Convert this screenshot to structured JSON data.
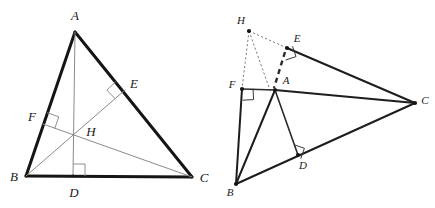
{
  "figure": {
    "background_color": "#ffffff",
    "width": 435,
    "height": 208,
    "panel_count": 2
  },
  "colors": {
    "side_stroke": "#151515",
    "cevian_stroke": "#8a8a8a",
    "dashed_stroke": "#7d7d7d",
    "right_angle_stroke": "#8f8f8f",
    "label_fill": "#1a1a1a",
    "point_fill": "#151515"
  },
  "left_panel": {
    "name": "acute-triangle-orthocenter",
    "description": "Acute triangle ABC with altitudes AD, BE and CF meeting at interior orthocenter H",
    "labels": [
      {
        "id": "A",
        "text": "A",
        "x": 75,
        "y": 17
      },
      {
        "id": "B",
        "text": "B",
        "x": 14,
        "y": 178
      },
      {
        "id": "C",
        "text": "C",
        "x": 204,
        "y": 179
      },
      {
        "id": "D",
        "text": "D",
        "x": 74,
        "y": 194
      },
      {
        "id": "E",
        "text": "E",
        "x": 134,
        "y": 85
      },
      {
        "id": "F",
        "text": "F",
        "x": 32,
        "y": 118
      },
      {
        "id": "H",
        "text": "H",
        "x": 91,
        "y": 133
      }
    ],
    "points": {
      "A": {
        "x": 75,
        "y": 32
      },
      "B": {
        "x": 26,
        "y": 176
      },
      "C": {
        "x": 192,
        "y": 177
      },
      "D": {
        "x": 73,
        "y": 176
      },
      "E": {
        "x": 125,
        "y": 90
      },
      "F": {
        "x": 43,
        "y": 124
      },
      "H": {
        "x": 73,
        "y": 133
      }
    },
    "sides": [
      {
        "name": "side-AB",
        "from": "A",
        "to": "B",
        "weight": "thick"
      },
      {
        "name": "side-AC",
        "from": "A",
        "to": "C",
        "weight": "thick"
      },
      {
        "name": "side-BC",
        "from": "B",
        "to": "C",
        "weight": "thick"
      }
    ],
    "altitudes": [
      {
        "name": "altitude-AD",
        "from": "A",
        "to": "D",
        "weight": "thin"
      },
      {
        "name": "altitude-BE",
        "from": "B",
        "to": "E",
        "weight": "thin"
      },
      {
        "name": "altitude-CF",
        "from": "C",
        "to": "F",
        "weight": "thin"
      }
    ],
    "right_angles": [
      {
        "name": "right-angle-at-D",
        "vertex": "D",
        "size": 12
      },
      {
        "name": "right-angle-at-E",
        "vertex": "E",
        "size": 12
      },
      {
        "name": "right-angle-at-F",
        "vertex": "F",
        "size": 12
      }
    ]
  },
  "right_panel": {
    "name": "obtuse-triangle-orthocenter",
    "description": "Obtuse triangle ABC with altitude feet D, E, F and exterior orthocenter H joined by dashed segments",
    "labels": [
      {
        "id": "H",
        "text": "H",
        "x": 241,
        "y": 21
      },
      {
        "id": "E",
        "text": "E",
        "x": 297,
        "y": 39
      },
      {
        "id": "A",
        "text": "A",
        "x": 286,
        "y": 81
      },
      {
        "id": "F",
        "text": "F",
        "x": 232,
        "y": 85
      },
      {
        "id": "C",
        "text": "C",
        "x": 425,
        "y": 101
      },
      {
        "id": "D",
        "text": "D",
        "x": 303,
        "y": 166
      },
      {
        "id": "B",
        "text": "B",
        "x": 230,
        "y": 193
      }
    ],
    "points": {
      "H": {
        "x": 249,
        "y": 31
      },
      "E": {
        "x": 287,
        "y": 48
      },
      "A": {
        "x": 275,
        "y": 90
      },
      "F": {
        "x": 242,
        "y": 89
      },
      "C": {
        "x": 415,
        "y": 103
      },
      "D": {
        "x": 298,
        "y": 155
      },
      "B": {
        "x": 236,
        "y": 184
      }
    },
    "sides": [
      {
        "name": "side-BC",
        "from": "B",
        "to": "C",
        "weight": "med"
      },
      {
        "name": "side-AC",
        "from": "A",
        "to": "C",
        "weight": "med"
      },
      {
        "name": "side-AB",
        "from": "A",
        "to": "B",
        "weight": "med"
      },
      {
        "name": "side-EC",
        "from": "E",
        "to": "C",
        "weight": "med"
      },
      {
        "name": "segment-BF",
        "from": "B",
        "to": "F",
        "weight": "med"
      }
    ],
    "cevians": [
      {
        "name": "cevian-AD",
        "from": "A",
        "to": "D",
        "weight": "dark"
      },
      {
        "name": "cevian-BD",
        "from": "B",
        "to": "D",
        "weight": "dark"
      }
    ],
    "dashed_segments": [
      {
        "name": "dashed-HF",
        "from": "H",
        "to": "F",
        "weight": "thin"
      },
      {
        "name": "dashed-HE",
        "from": "H",
        "to": "E",
        "weight": "thin"
      },
      {
        "name": "dashed-HB",
        "from": "H",
        "to": "B",
        "weight": "thin"
      },
      {
        "name": "dashed-EA",
        "from": "E",
        "to": "A",
        "weight": "thick"
      }
    ],
    "right_angles": [
      {
        "name": "right-angle-at-E",
        "vertex": "E",
        "size": 11
      },
      {
        "name": "right-angle-at-F",
        "vertex": "F",
        "size": 11
      },
      {
        "name": "right-angle-at-D",
        "vertex": "D",
        "size": 11
      }
    ],
    "marked_points": [
      "H",
      "E",
      "A",
      "F",
      "C",
      "D",
      "B"
    ]
  }
}
